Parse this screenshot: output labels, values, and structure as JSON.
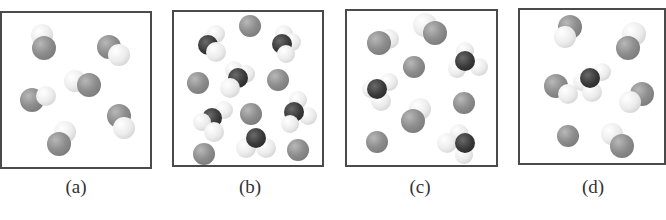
{
  "figure": {
    "panels": [
      {
        "id": "a",
        "label": "(a)",
        "box": {
          "left": 0,
          "top": 11,
          "width": 152,
          "height": 158
        },
        "label_pos": {
          "x": 76,
          "y": 176
        },
        "description": "six diatomic molecules (gray + white atom)",
        "atoms": [
          {
            "t": "white",
            "x": 40,
            "y": 22,
            "r": 11
          },
          {
            "t": "gray",
            "x": 42,
            "y": 35,
            "r": 12
          },
          {
            "t": "gray",
            "x": 107,
            "y": 34,
            "r": 12
          },
          {
            "t": "white",
            "x": 117,
            "y": 42,
            "r": 11
          },
          {
            "t": "white",
            "x": 73,
            "y": 68,
            "r": 11
          },
          {
            "t": "gray",
            "x": 87,
            "y": 72,
            "r": 12
          },
          {
            "t": "gray",
            "x": 30,
            "y": 87,
            "r": 12
          },
          {
            "t": "white",
            "x": 44,
            "y": 83,
            "r": 10
          },
          {
            "t": "gray",
            "x": 117,
            "y": 103,
            "r": 12
          },
          {
            "t": "white",
            "x": 122,
            "y": 115,
            "r": 11
          },
          {
            "t": "white",
            "x": 63,
            "y": 119,
            "r": 11
          },
          {
            "t": "gray",
            "x": 57,
            "y": 131,
            "r": 12
          }
        ]
      },
      {
        "id": "b",
        "label": "(b)",
        "box": {
          "left": 172,
          "top": 10,
          "width": 152,
          "height": 157
        },
        "label_pos": {
          "x": 250,
          "y": 176
        },
        "description": "seven single gray atoms and six tetrahedral molecules (dark center with white atoms)",
        "atoms": [
          {
            "t": "gray",
            "x": 76,
            "y": 14,
            "r": 11
          },
          {
            "t": "white",
            "x": 34,
            "y": 30,
            "r": 9
          },
          {
            "t": "white",
            "x": 42,
            "y": 22,
            "r": 9
          },
          {
            "t": "dark",
            "x": 34,
            "y": 33,
            "r": 10
          },
          {
            "t": "white",
            "x": 42,
            "y": 40,
            "r": 10
          },
          {
            "t": "white",
            "x": 110,
            "y": 22,
            "r": 9
          },
          {
            "t": "white",
            "x": 118,
            "y": 30,
            "r": 9
          },
          {
            "t": "dark",
            "x": 108,
            "y": 32,
            "r": 10
          },
          {
            "t": "white",
            "x": 112,
            "y": 42,
            "r": 9
          },
          {
            "t": "gray",
            "x": 24,
            "y": 71,
            "r": 11
          },
          {
            "t": "white",
            "x": 60,
            "y": 58,
            "r": 9
          },
          {
            "t": "white",
            "x": 72,
            "y": 62,
            "r": 9
          },
          {
            "t": "dark",
            "x": 64,
            "y": 66,
            "r": 10
          },
          {
            "t": "white",
            "x": 56,
            "y": 76,
            "r": 10
          },
          {
            "t": "gray",
            "x": 104,
            "y": 68,
            "r": 11
          },
          {
            "t": "white",
            "x": 50,
            "y": 98,
            "r": 9
          },
          {
            "t": "dark",
            "x": 38,
            "y": 106,
            "r": 10
          },
          {
            "t": "white",
            "x": 28,
            "y": 110,
            "r": 9
          },
          {
            "t": "white",
            "x": 40,
            "y": 120,
            "r": 10
          },
          {
            "t": "gray",
            "x": 77,
            "y": 102,
            "r": 11
          },
          {
            "t": "white",
            "x": 124,
            "y": 88,
            "r": 9
          },
          {
            "t": "white",
            "x": 134,
            "y": 104,
            "r": 9
          },
          {
            "t": "dark",
            "x": 120,
            "y": 100,
            "r": 10
          },
          {
            "t": "white",
            "x": 116,
            "y": 112,
            "r": 9
          },
          {
            "t": "gray",
            "x": 30,
            "y": 142,
            "r": 11
          },
          {
            "t": "white",
            "x": 72,
            "y": 136,
            "r": 10
          },
          {
            "t": "white",
            "x": 92,
            "y": 136,
            "r": 10
          },
          {
            "t": "dark",
            "x": 82,
            "y": 126,
            "r": 10
          },
          {
            "t": "gray",
            "x": 124,
            "y": 138,
            "r": 11
          }
        ]
      },
      {
        "id": "c",
        "label": "(c)",
        "box": {
          "left": 345,
          "top": 9,
          "width": 153,
          "height": 158
        },
        "label_pos": {
          "x": 420,
          "y": 176
        },
        "description": "diatomic molecules, single gray atoms and tetrahedral molecules (mixture)",
        "atoms": [
          {
            "t": "white",
            "x": 42,
            "y": 28,
            "r": 10
          },
          {
            "t": "gray",
            "x": 32,
            "y": 32,
            "r": 12
          },
          {
            "t": "white",
            "x": 78,
            "y": 14,
            "r": 12
          },
          {
            "t": "gray",
            "x": 88,
            "y": 22,
            "r": 12
          },
          {
            "t": "gray",
            "x": 67,
            "y": 56,
            "r": 11
          },
          {
            "t": "white",
            "x": 118,
            "y": 40,
            "r": 9
          },
          {
            "t": "white",
            "x": 132,
            "y": 56,
            "r": 9
          },
          {
            "t": "white",
            "x": 110,
            "y": 58,
            "r": 9
          },
          {
            "t": "dark",
            "x": 118,
            "y": 50,
            "r": 10
          },
          {
            "t": "white",
            "x": 42,
            "y": 71,
            "r": 9
          },
          {
            "t": "white",
            "x": 24,
            "y": 78,
            "r": 9
          },
          {
            "t": "white",
            "x": 34,
            "y": 90,
            "r": 10
          },
          {
            "t": "dark",
            "x": 30,
            "y": 78,
            "r": 10
          },
          {
            "t": "gray",
            "x": 117,
            "y": 92,
            "r": 11
          },
          {
            "t": "white",
            "x": 73,
            "y": 98,
            "r": 11
          },
          {
            "t": "gray",
            "x": 66,
            "y": 110,
            "r": 12
          },
          {
            "t": "gray",
            "x": 30,
            "y": 131,
            "r": 11
          },
          {
            "t": "white",
            "x": 112,
            "y": 122,
            "r": 9
          },
          {
            "t": "white",
            "x": 100,
            "y": 132,
            "r": 10
          },
          {
            "t": "white",
            "x": 117,
            "y": 144,
            "r": 9
          },
          {
            "t": "dark",
            "x": 118,
            "y": 132,
            "r": 10
          }
        ]
      },
      {
        "id": "d",
        "label": "(d)",
        "box": {
          "left": 518,
          "top": 8,
          "width": 148,
          "height": 157
        },
        "label_pos": {
          "x": 593,
          "y": 176
        },
        "description": "five diatomic molecules, one single gray atom and one tetrahedral molecule",
        "atoms": [
          {
            "t": "gray",
            "x": 50,
            "y": 17,
            "r": 12
          },
          {
            "t": "white",
            "x": 45,
            "y": 27,
            "r": 11
          },
          {
            "t": "white",
            "x": 114,
            "y": 24,
            "r": 12
          },
          {
            "t": "gray",
            "x": 108,
            "y": 38,
            "r": 12
          },
          {
            "t": "white",
            "x": 62,
            "y": 72,
            "r": 9
          },
          {
            "t": "white",
            "x": 82,
            "y": 62,
            "r": 9
          },
          {
            "t": "white",
            "x": 72,
            "y": 82,
            "r": 10
          },
          {
            "t": "dark",
            "x": 70,
            "y": 68,
            "r": 10
          },
          {
            "t": "gray",
            "x": 36,
            "y": 76,
            "r": 12
          },
          {
            "t": "white",
            "x": 48,
            "y": 84,
            "r": 10
          },
          {
            "t": "gray",
            "x": 122,
            "y": 84,
            "r": 12
          },
          {
            "t": "white",
            "x": 110,
            "y": 92,
            "r": 11
          },
          {
            "t": "gray",
            "x": 48,
            "y": 126,
            "r": 11
          },
          {
            "t": "white",
            "x": 92,
            "y": 124,
            "r": 11
          },
          {
            "t": "gray",
            "x": 102,
            "y": 136,
            "r": 12
          }
        ]
      }
    ]
  }
}
